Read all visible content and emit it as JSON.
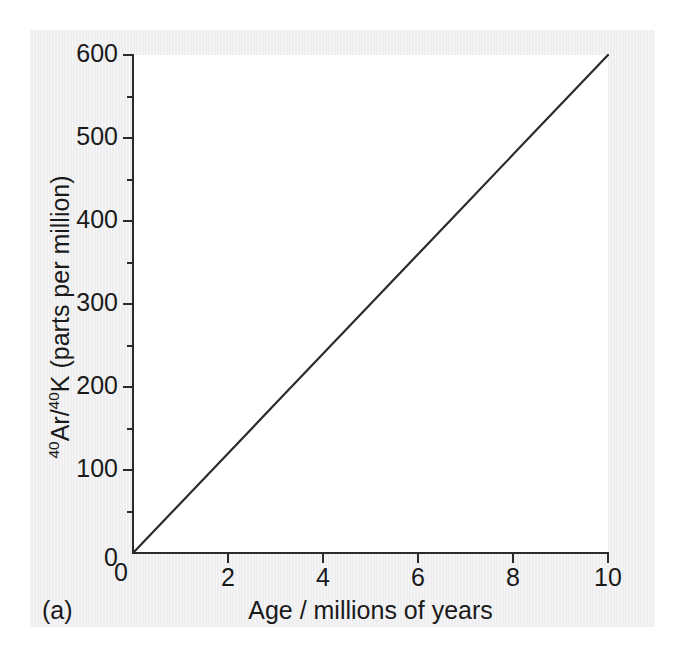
{
  "figure": {
    "panel_label": "(a)",
    "background_color": "#eeeef0",
    "plot_background_color": "#ffffff",
    "line_color": "#2b2b2b",
    "axis_color": "#2b2b2b",
    "text_color": "#1a1a1a"
  },
  "axes": {
    "x": {
      "title": "Age / millions of years",
      "tick_labels": [
        "0",
        "2",
        "4",
        "6",
        "8",
        "10"
      ],
      "tick_values": [
        0,
        2,
        4,
        6,
        8,
        10
      ],
      "range": [
        0,
        10
      ],
      "minor_ticks": false,
      "tick_direction": "out"
    },
    "y": {
      "title_html": "<sup>40</sup>Ar/<sup>40</sup>K (parts per million)",
      "title_plain": "40Ar/40K (parts per million)",
      "tick_labels": [
        "0",
        "100",
        "200",
        "300",
        "400",
        "500",
        "600"
      ],
      "tick_values": [
        0,
        100,
        200,
        300,
        400,
        500,
        600
      ],
      "minor_tick_values": [
        50,
        150,
        250,
        350,
        450,
        550
      ],
      "range": [
        0,
        600
      ],
      "minor_ticks": true,
      "tick_direction": "out"
    }
  },
  "chart_data": {
    "type": "line",
    "title": "",
    "subtitle": "",
    "xlabel": "Age / millions of years",
    "ylabel": "40Ar/40K (parts per million)",
    "xlim": [
      0,
      10
    ],
    "ylim": [
      0,
      600
    ],
    "grid": false,
    "legend": null,
    "annotations": [
      "(a)"
    ],
    "series": [
      {
        "name": "40Ar/40K ratio vs age",
        "x": [
          0,
          1,
          2,
          3,
          4,
          5,
          6,
          7,
          8,
          9,
          10
        ],
        "values": [
          0,
          60,
          120,
          180,
          240,
          300,
          360,
          420,
          480,
          540,
          600
        ],
        "slope": 60,
        "intercept": 0,
        "color": "#2b2b2b",
        "marker": "none",
        "linewidth": 2
      }
    ]
  }
}
